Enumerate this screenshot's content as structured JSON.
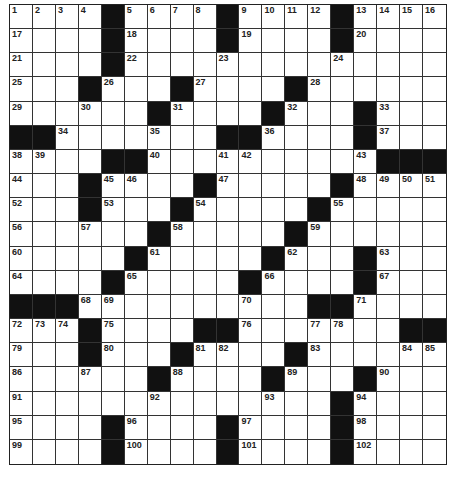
{
  "puzzle": {
    "rows": 19,
    "cols": 19,
    "block_color": "#111111",
    "grid": [
      [
        "1",
        "2",
        "3",
        "4",
        "#",
        "5",
        "6",
        "7",
        "8",
        "#",
        "9",
        "10",
        "11",
        "12",
        "#",
        "13",
        "14",
        "15",
        "16"
      ],
      [
        "17",
        ".",
        ".",
        ".",
        "#",
        "18",
        ".",
        ".",
        ".",
        "#",
        "19",
        ".",
        ".",
        ".",
        "#",
        "20",
        ".",
        ".",
        "."
      ],
      [
        "21",
        ".",
        ".",
        ".",
        "#",
        "22",
        ".",
        ".",
        ".",
        "23",
        ".",
        ".",
        ".",
        ".",
        "24",
        ".",
        ".",
        ".",
        "."
      ],
      [
        "25",
        ".",
        ".",
        "#",
        "26",
        ".",
        ".",
        "#",
        "27",
        ".",
        ".",
        ".",
        "#",
        "28",
        ".",
        ".",
        ".",
        ".",
        "."
      ],
      [
        "29",
        ".",
        ".",
        "30",
        ".",
        ".",
        "#",
        "31",
        ".",
        ".",
        ".",
        "#",
        "32",
        ".",
        ".",
        "#",
        "33",
        ".",
        "."
      ],
      [
        "#",
        "#",
        "34",
        ".",
        ".",
        ".",
        "35",
        ".",
        ".",
        "#",
        "#",
        "36",
        ".",
        ".",
        ".",
        "#",
        "37",
        ".",
        "."
      ],
      [
        "38",
        "39",
        ".",
        ".",
        "#",
        "#",
        "40",
        ".",
        ".",
        "41",
        "42",
        ".",
        ".",
        ".",
        ".",
        "43",
        "#",
        "#",
        "#"
      ],
      [
        "44",
        ".",
        ".",
        "#",
        "45",
        "46",
        ".",
        ".",
        "#",
        "47",
        ".",
        ".",
        ".",
        ".",
        "#",
        "48",
        "49",
        "50",
        "51"
      ],
      [
        "52",
        ".",
        ".",
        "#",
        "53",
        ".",
        ".",
        "#",
        "54",
        ".",
        ".",
        ".",
        ".",
        "#",
        "55",
        ".",
        ".",
        ".",
        "."
      ],
      [
        "56",
        ".",
        ".",
        "57",
        ".",
        ".",
        "#",
        "58",
        ".",
        ".",
        ".",
        ".",
        "#",
        "59",
        ".",
        ".",
        ".",
        ".",
        "."
      ],
      [
        "60",
        ".",
        ".",
        ".",
        ".",
        "#",
        "61",
        ".",
        ".",
        ".",
        ".",
        "#",
        "62",
        ".",
        ".",
        "#",
        "63",
        ".",
        "."
      ],
      [
        "64",
        ".",
        ".",
        ".",
        "#",
        "65",
        ".",
        ".",
        ".",
        ".",
        "#",
        "66",
        ".",
        ".",
        ".",
        "#",
        "67",
        ".",
        "."
      ],
      [
        "#",
        "#",
        "#",
        "68",
        "69",
        ".",
        ".",
        ".",
        ".",
        ".",
        "70",
        ".",
        ".",
        "#",
        "#",
        "71",
        ".",
        ".",
        "."
      ],
      [
        "72",
        "73",
        "74",
        "#",
        "75",
        ".",
        ".",
        ".",
        "#",
        "#",
        "76",
        ".",
        ".",
        "77",
        "78",
        ".",
        ".",
        "#",
        "#"
      ],
      [
        "79",
        ".",
        ".",
        "#",
        "80",
        ".",
        ".",
        "#",
        "81",
        "82",
        ".",
        ".",
        "#",
        "83",
        ".",
        ".",
        ".",
        "84",
        "85"
      ],
      [
        "86",
        ".",
        ".",
        "87",
        ".",
        ".",
        "#",
        "88",
        ".",
        ".",
        ".",
        "#",
        "89",
        ".",
        ".",
        "#",
        "90",
        ".",
        "."
      ],
      [
        "91",
        ".",
        ".",
        ".",
        ".",
        ".",
        "92",
        ".",
        ".",
        ".",
        ".",
        "93",
        ".",
        ".",
        "#",
        "94",
        ".",
        ".",
        "."
      ],
      [
        "95",
        ".",
        ".",
        ".",
        "#",
        "96",
        ".",
        ".",
        ".",
        "#",
        "97",
        ".",
        ".",
        ".",
        "#",
        "98",
        ".",
        ".",
        "."
      ],
      [
        "99",
        ".",
        ".",
        ".",
        "#",
        "100",
        ".",
        ".",
        ".",
        "#",
        "101",
        ".",
        ".",
        ".",
        "#",
        "102",
        ".",
        ".",
        "."
      ]
    ]
  }
}
